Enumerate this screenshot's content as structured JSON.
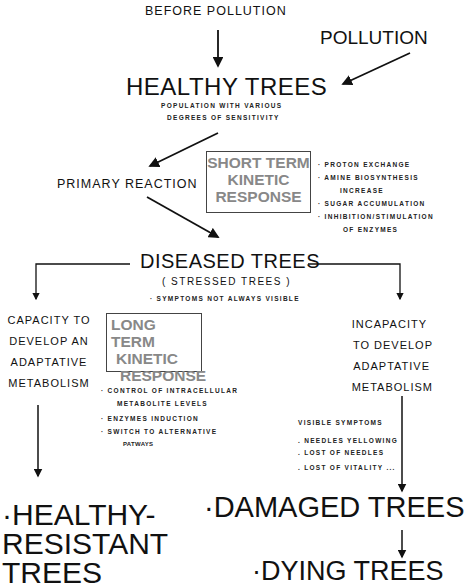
{
  "top": {
    "before_pollution": "BEFORE POLLUTION",
    "pollution": "POLLUTION"
  },
  "healthy_trees": {
    "title": "HEALTHY TREES",
    "subtitle_line1": "POPULATION WITH VARIOUS",
    "subtitle_line2": "DEGREES OF SENSITIVITY"
  },
  "primary_reaction": "PRIMARY REACTION",
  "short_term_box": {
    "line1": "SHORT TERM",
    "line2": "KINETIC",
    "line3": "RESPONSE"
  },
  "short_term_list": [
    "· PROTON EXCHANGE",
    "· AMINE BIOSYNTHESIS",
    "INCREASE",
    "· SUGAR ACCUMULATION",
    "· INHIBITION/STIMULATION",
    "OF ENZYMES"
  ],
  "diseased_trees": {
    "title": "DISEASED TREES",
    "subtitle": "( STRESSED TREES )",
    "note": "· SYMPTOMS NOT ALWAYS VISIBLE"
  },
  "capacity": [
    "CAPACITY TO",
    "DEVELOP AN",
    "ADAPTATIVE",
    "METABOLISM"
  ],
  "long_term_box": {
    "line1": "LONG TERM",
    "line2": "KINETIC",
    "line3": "RESPONSE"
  },
  "long_term_list": [
    "· CONTROL OF INTRACELLULAR",
    "METABOLITE LEVELS",
    "· ENZYMES INDUCTION",
    "· SWITCH TO ALTERNATIVE",
    "PATWAYS"
  ],
  "incapacity": [
    "INCAPACITY",
    "TO DEVELOP",
    "ADAPTATIVE",
    "METABOLISM"
  ],
  "visible_symptoms": {
    "title": "VISIBLE SYMPTOMS",
    "items": [
      ". NEEDLES YELLOWING",
      ". LOST OF NEEDLES",
      ". LOST OF VITALITY ..."
    ]
  },
  "outcomes": {
    "healthy_resistant": [
      "·HEALTHY-",
      "RESISTANT",
      "TREES"
    ],
    "damaged": "·DAMAGED TREES",
    "dying": "·DYING TREES"
  }
}
